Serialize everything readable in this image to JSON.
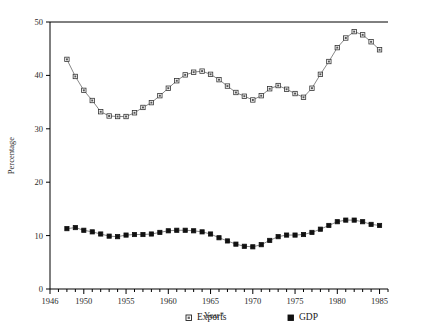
{
  "chart_data": {
    "type": "line",
    "title": "",
    "xlabel": "Year*",
    "ylabel": "Percentage",
    "ylim": [
      0,
      50
    ],
    "xlim": [
      1946,
      1986
    ],
    "ytick_labels": [
      "0",
      "10",
      "20",
      "30",
      "40",
      "50"
    ],
    "yticks": [
      0,
      10,
      20,
      30,
      40,
      50
    ],
    "xtick_labels": [
      "1946",
      "1950",
      "1955",
      "1960",
      "1965",
      "1970",
      "1975",
      "1980",
      "1985"
    ],
    "xticks_labeled": [
      1946,
      1950,
      1955,
      1960,
      1965,
      1970,
      1975,
      1980,
      1985
    ],
    "minor_tick_interval": 1,
    "grid": false,
    "legend_position": "below-axes",
    "x": [
      1948,
      1949,
      1950,
      1951,
      1952,
      1953,
      1954,
      1955,
      1956,
      1957,
      1958,
      1959,
      1960,
      1961,
      1962,
      1963,
      1964,
      1965,
      1966,
      1967,
      1968,
      1969,
      1970,
      1971,
      1972,
      1973,
      1974,
      1975,
      1976,
      1977,
      1978,
      1979,
      1980,
      1981,
      1982,
      1983,
      1984,
      1985
    ],
    "series": [
      {
        "name": "Exports",
        "marker": "open-square",
        "values": [
          43.0,
          39.8,
          37.2,
          35.3,
          33.2,
          32.4,
          32.3,
          32.3,
          33.0,
          34.0,
          34.9,
          36.2,
          37.6,
          39.0,
          40.1,
          40.6,
          40.8,
          40.2,
          39.2,
          38.0,
          36.8,
          36.1,
          35.4,
          36.2,
          37.5,
          38.1,
          37.4,
          36.6,
          35.9,
          37.6,
          40.2,
          42.6,
          45.2,
          47.0,
          48.2,
          47.6,
          46.3,
          44.8
        ]
      },
      {
        "name": "GDP",
        "marker": "filled-square",
        "values": [
          11.3,
          11.5,
          11.0,
          10.7,
          10.3,
          9.9,
          9.8,
          10.1,
          10.2,
          10.2,
          10.3,
          10.6,
          10.9,
          11.0,
          11.0,
          10.9,
          10.7,
          10.3,
          9.6,
          9.0,
          8.4,
          8.0,
          7.9,
          8.3,
          9.1,
          9.8,
          10.1,
          10.1,
          10.2,
          10.6,
          11.2,
          11.9,
          12.6,
          12.9,
          12.9,
          12.6,
          12.1,
          11.9
        ]
      }
    ]
  },
  "legend": {
    "items": [
      {
        "label": "Exports",
        "marker": "open-square"
      },
      {
        "label": "GDP",
        "marker": "filled-square"
      }
    ]
  },
  "colors": {
    "axis": "#000000",
    "line": "#555555",
    "marker_fill_open": "#ffffff",
    "marker_fill_closed": "#111111",
    "text": "#1a1a1a",
    "background": "#ffffff"
  }
}
